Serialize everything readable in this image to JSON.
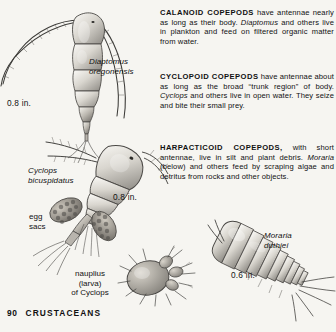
{
  "page": {
    "background_color": "#f6f5f1",
    "ink_color": "#111111",
    "footer": {
      "page_number": "90",
      "section_title": "CRUSTACEANS"
    }
  },
  "text_column": {
    "paragraphs": [
      {
        "id": "calanoid",
        "heading": "CALANOID COPEPODS",
        "body_before_italic": " have antennae nearly as long as their body. ",
        "italic_term": "Diaptomus",
        "body_after_italic": " and others live in plankton and feed on filtered organic matter from water.",
        "full_text": "CALANOID COPEPODS have antennae nearly as long as their body. Diaptomus and others live in plankton and feed on filtered organic matter from water."
      },
      {
        "id": "cyclopoid",
        "heading": "CYCLOPOID COPEPODS",
        "body_before_italic": " have antennae about as long as the broad “trunk region” of body. ",
        "italic_term": "Cyclops",
        "body_after_italic": " and others live in open water. They seize and bite their small prey.",
        "full_text": "CYCLOPOID COPEPODS have antennae about as long as the broad “trunk region” of body. Cyclops and others live in open water. They seize and bite their small prey."
      },
      {
        "id": "harpacticoid",
        "heading": "HARPACTICOID COPEPODS,",
        "body_before_italic": " with short antennae, live in silt and plant debris. ",
        "italic_term": "Moraria",
        "body_after_italic": " (below) and others feed by scraping algae and detritus from rocks and other objects.",
        "full_text": "HARPACTICOID COPEPODS, with short antennae, live in silt and plant debris. Moraria (below) and others feed by scraping algae and detritus from rocks and other objects."
      }
    ]
  },
  "figures": {
    "diaptomus": {
      "species_label": "Diaptomus\noregonensis",
      "size_label": "0.8 in."
    },
    "cyclops": {
      "species_label": "Cyclops\nbicuspidatus",
      "size_label": "0.8 in.",
      "part_label": "egg\nsacs"
    },
    "nauplius": {
      "caption": "nauplius\n(larva)\nof Cyclops"
    },
    "moraria": {
      "species_label": "Moraria\nduthiei",
      "size_label": "0.6 in."
    }
  }
}
